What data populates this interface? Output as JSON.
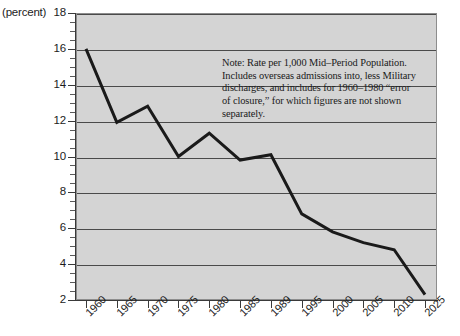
{
  "chart_data": {
    "type": "line",
    "title": "",
    "xlabel": "",
    "ylabel": "(percent)",
    "unit_label": "(percent)",
    "categories": [
      "1960",
      "1965",
      "1970",
      "1975",
      "1980",
      "1985",
      "1989",
      "1995",
      "2000",
      "2005",
      "2010",
      "2025"
    ],
    "values": [
      16.0,
      11.9,
      12.8,
      10.0,
      11.3,
      9.8,
      10.1,
      6.8,
      5.8,
      5.2,
      4.8,
      2.3
    ],
    "series": [
      {
        "name": "Rate per 1,000 Mid-Period Population",
        "values": [
          16.0,
          11.9,
          12.8,
          10.0,
          11.3,
          9.8,
          10.1,
          6.8,
          5.8,
          5.2,
          4.8,
          2.3
        ]
      }
    ],
    "ylim": [
      2,
      18
    ],
    "ytick_labels": [
      "18",
      "16",
      "14",
      "12",
      "10",
      "8",
      "6",
      "4",
      "2"
    ],
    "ytick_values": [
      18,
      16,
      14,
      12,
      10,
      8,
      6,
      4,
      2
    ],
    "yminor_step": 0.5,
    "grid": true,
    "legend": "none",
    "note": "Note: Rate per 1,000 Mid–Period Population. Includes overseas admissions into, less Military discharges, and includes for 1960–1980 “error of closure,” for which figures are not shown separately.",
    "colors": {
      "plot_background": "#d4d4d4",
      "gridline": "#4a4a4a",
      "series_line": "#1a1a1a",
      "axis": "#3a3a3a",
      "text": "#1c1c1c",
      "page_background": "#ffffff"
    }
  }
}
